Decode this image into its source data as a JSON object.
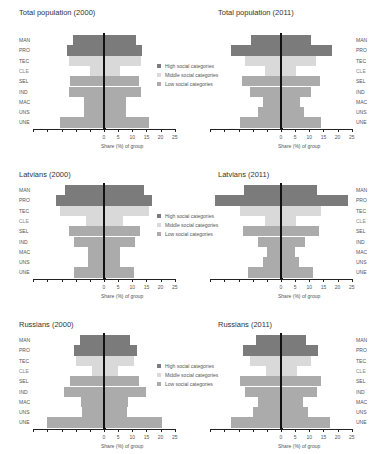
{
  "chart_data": [
    {
      "type": "bar",
      "subtype": "population-pyramid",
      "title": "Total population (2000)",
      "xlabel": "Share (%) of group",
      "ylabel": "",
      "categories": [
        "MAN",
        "PRO",
        "TEC",
        "CLE",
        "SEL",
        "IND",
        "MAC",
        "UNS",
        "UNE"
      ],
      "category_group": [
        "high",
        "high",
        "middle",
        "middle",
        "low",
        "low",
        "low",
        "low",
        "low"
      ],
      "series": [
        {
          "name": "Left side",
          "values": [
            11.0,
            13.1,
            12.3,
            5.1,
            11.9,
            12.5,
            6.9,
            6.9,
            15.7
          ]
        },
        {
          "name": "Right side",
          "values": [
            11.2,
            13.6,
            12.9,
            5.6,
            12.4,
            13.2,
            7.7,
            7.7,
            15.9
          ]
        }
      ],
      "xticks": [
        "0",
        "5",
        "10",
        "15",
        "20",
        "25"
      ],
      "xlim": [
        -25,
        25
      ],
      "legend_position": "right"
    },
    {
      "type": "bar",
      "subtype": "population-pyramid",
      "title": "Total population (2011)",
      "xlabel": "Share (%) of group",
      "ylabel": "",
      "categories": [
        "MAN",
        "PRO",
        "TEC",
        "CLE",
        "SEL",
        "IND",
        "MAC",
        "UNS",
        "UNE"
      ],
      "category_group": [
        "high",
        "high",
        "middle",
        "middle",
        "low",
        "low",
        "low",
        "low",
        "low"
      ],
      "series": [
        {
          "name": "Left side",
          "values": [
            10.7,
            17.6,
            12.6,
            5.5,
            13.7,
            10.8,
            6.3,
            8.1,
            14.4
          ]
        },
        {
          "name": "Right side",
          "values": [
            10.7,
            17.9,
            12.5,
            5.2,
            13.7,
            10.7,
            6.8,
            8.0,
            14.3
          ]
        }
      ],
      "xticks": [
        "0",
        "5",
        "10",
        "15",
        "20",
        "25"
      ],
      "xlim": [
        -25,
        25
      ]
    },
    {
      "type": "bar",
      "subtype": "population-pyramid",
      "title": "Latvians (2000)",
      "xlabel": "Share (%) of group",
      "ylabel": "",
      "categories": [
        "MAN",
        "PRO",
        "TEC",
        "CLE",
        "SEL",
        "IND",
        "MAC",
        "UNS",
        "UNE"
      ],
      "category_group": [
        "high",
        "high",
        "middle",
        "middle",
        "low",
        "low",
        "low",
        "low",
        "low"
      ],
      "series": [
        {
          "name": "Left side",
          "values": [
            13.7,
            16.8,
            15.4,
            6.3,
            12.5,
            10.5,
            5.5,
            5.5,
            10.5
          ]
        },
        {
          "name": "Right side",
          "values": [
            14.0,
            17.1,
            15.9,
            6.6,
            12.6,
            10.9,
            5.6,
            5.6,
            10.5
          ]
        }
      ],
      "xticks": [
        "0",
        "5",
        "10",
        "15",
        "20",
        "25"
      ],
      "xlim": [
        -25,
        25
      ],
      "legend_position": "right"
    },
    {
      "type": "bar",
      "subtype": "population-pyramid",
      "title": "Latvians (2011)",
      "xlabel": "Share (%) of group",
      "ylabel": "",
      "categories": [
        "MAN",
        "PRO",
        "TEC",
        "CLE",
        "SEL",
        "IND",
        "MAC",
        "UNS",
        "UNE"
      ],
      "category_group": [
        "high",
        "high",
        "middle",
        "middle",
        "low",
        "low",
        "low",
        "low",
        "low"
      ],
      "series": [
        {
          "name": "Left side",
          "values": [
            13.1,
            23.3,
            14.6,
            5.5,
            13.3,
            8.3,
            4.8,
            6.3,
            11.7
          ]
        },
        {
          "name": "Right side",
          "values": [
            12.7,
            23.5,
            14.3,
            5.4,
            13.3,
            8.6,
            4.8,
            6.2,
            11.2
          ]
        }
      ],
      "xticks": [
        "0",
        "5",
        "10",
        "15",
        "20",
        "25"
      ],
      "xlim": [
        -25,
        25
      ]
    },
    {
      "type": "bar",
      "subtype": "population-pyramid",
      "title": "Russians (2000)",
      "xlabel": "Share (%) of group",
      "ylabel": "",
      "categories": [
        "MAN",
        "PRO",
        "TEC",
        "CLE",
        "SEL",
        "IND",
        "MAC",
        "UNS",
        "UNE"
      ],
      "category_group": [
        "high",
        "high",
        "middle",
        "middle",
        "low",
        "low",
        "low",
        "low",
        "low"
      ],
      "series": [
        {
          "name": "Left side",
          "values": [
            8.4,
            10.7,
            9.8,
            4.4,
            11.9,
            14.2,
            8.2,
            7.9,
            20.1
          ]
        },
        {
          "name": "Right side",
          "values": [
            9.1,
            11.5,
            10.5,
            4.9,
            12.4,
            15.0,
            8.4,
            8.2,
            20.6
          ]
        }
      ],
      "xticks": [
        "0",
        "5",
        "10",
        "15",
        "20",
        "25"
      ],
      "xlim": [
        -25,
        25
      ],
      "legend_position": "right"
    },
    {
      "type": "bar",
      "subtype": "population-pyramid",
      "title": "Russians (2011)",
      "xlabel": "Share (%) of group",
      "ylabel": "",
      "categories": [
        "MAN",
        "PRO",
        "TEC",
        "CLE",
        "SEL",
        "IND",
        "MAC",
        "UNS",
        "UNE"
      ],
      "category_group": [
        "high",
        "high",
        "middle",
        "middle",
        "low",
        "low",
        "low",
        "low",
        "low"
      ],
      "series": [
        {
          "name": "Left side",
          "values": [
            8.8,
            13.4,
            11.0,
            5.4,
            14.5,
            12.8,
            8.0,
            9.8,
            17.5
          ]
        },
        {
          "name": "Right side",
          "values": [
            8.9,
            13.2,
            10.7,
            5.5,
            14.3,
            12.6,
            7.9,
            9.5,
            17.4
          ]
        }
      ],
      "xticks": [
        "0",
        "5",
        "10",
        "15",
        "20",
        "25"
      ],
      "xlim": [
        -25,
        25
      ]
    }
  ],
  "legend": {
    "items": [
      {
        "label": "High social categories",
        "color": "#7b7b7b"
      },
      {
        "label": "Middle social categories",
        "color": "#d9d9d9"
      },
      {
        "label": "Low social categories",
        "color": "#ababab"
      }
    ]
  },
  "colors": {
    "high": "#7b7b7b",
    "middle": "#d9d9d9",
    "low": "#ababab",
    "axis": "#222222"
  }
}
